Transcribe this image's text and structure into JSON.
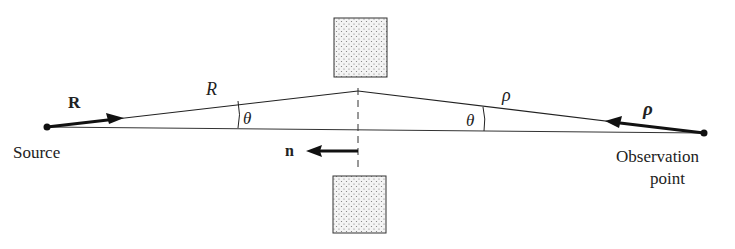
{
  "labels": {
    "source": "Source",
    "observation_line1": "Observation",
    "observation_line2": "point",
    "vec_R": "R",
    "len_R": "R",
    "vec_rho": "ρ",
    "len_rho": "ρ",
    "theta_left": "θ",
    "theta_right": "θ",
    "normal": "n"
  },
  "colors": {
    "ink": "#222222",
    "stipple_fill": "#f2f2f2"
  }
}
